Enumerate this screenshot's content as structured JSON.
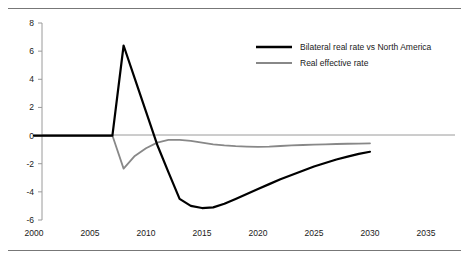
{
  "chart_data": {
    "type": "line",
    "title": "",
    "xlabel": "",
    "ylabel": "",
    "xlim": [
      2000,
      2035
    ],
    "ylim": [
      -6,
      8
    ],
    "xticks": [
      "2000",
      "2005",
      "2010",
      "2015",
      "2020",
      "2025",
      "2030",
      "2035"
    ],
    "yticks": [
      "8",
      "6",
      "4",
      "2",
      "0",
      "-2",
      "-4",
      "-6"
    ],
    "grid": false,
    "legend_position": "top-right",
    "zero_line": true,
    "series": [
      {
        "name": "Bilateral real rate vs North America",
        "color": "#000000",
        "width": 2.2,
        "x": [
          2000,
          2001,
          2002,
          2003,
          2004,
          2005,
          2006,
          2007,
          2008,
          2009,
          2010,
          2011,
          2012,
          2013,
          2014,
          2015,
          2016,
          2017,
          2018,
          2019,
          2020,
          2021,
          2022,
          2023,
          2024,
          2025,
          2026,
          2027,
          2028,
          2029,
          2030
        ],
        "values": [
          0,
          0,
          0,
          0,
          0,
          0,
          0,
          0,
          6.4,
          4.05,
          1.7,
          -0.65,
          -2.6,
          -4.5,
          -5.0,
          -5.15,
          -5.1,
          -4.85,
          -4.5,
          -4.15,
          -3.8,
          -3.45,
          -3.1,
          -2.8,
          -2.5,
          -2.2,
          -1.95,
          -1.7,
          -1.5,
          -1.3,
          -1.15
        ]
      },
      {
        "name": "Real effective rate",
        "color": "#888888",
        "width": 1.8,
        "x": [
          2000,
          2001,
          2002,
          2003,
          2004,
          2005,
          2006,
          2007,
          2008,
          2009,
          2010,
          2011,
          2012,
          2013,
          2014,
          2015,
          2016,
          2017,
          2018,
          2019,
          2020,
          2021,
          2022,
          2023,
          2024,
          2025,
          2026,
          2027,
          2028,
          2029,
          2030
        ],
        "values": [
          0,
          0,
          0,
          0,
          0,
          0,
          0,
          0,
          -2.35,
          -1.45,
          -0.9,
          -0.5,
          -0.3,
          -0.3,
          -0.38,
          -0.5,
          -0.62,
          -0.7,
          -0.75,
          -0.78,
          -0.8,
          -0.78,
          -0.74,
          -0.7,
          -0.67,
          -0.64,
          -0.62,
          -0.6,
          -0.58,
          -0.57,
          -0.55
        ]
      }
    ]
  },
  "legend": {
    "items": [
      {
        "label": "Bilateral real rate vs North America",
        "color": "#000000"
      },
      {
        "label": "Real effective rate",
        "color": "#888888"
      }
    ]
  },
  "axis": {
    "y_labels": [
      "8",
      "6",
      "4",
      "2",
      "0",
      "-2",
      "-4",
      "-6"
    ],
    "x_labels": [
      "2000",
      "2005",
      "2010",
      "2015",
      "2020",
      "2025",
      "2030",
      "2035"
    ]
  },
  "colors": {
    "series_primary": "#000000",
    "series_secondary": "#888888",
    "axis": "#9a9a9a",
    "rule": "#777777",
    "text": "#1a1a1a"
  }
}
